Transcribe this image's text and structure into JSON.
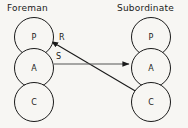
{
  "diagram": {
    "background_color": "#f7f6f3",
    "stroke_color": "#1a1a1a",
    "columns": [
      {
        "id": "foreman",
        "title": "Foreman",
        "nodes": [
          {
            "id": "foreman-p",
            "label": "P"
          },
          {
            "id": "foreman-a",
            "label": "A"
          },
          {
            "id": "foreman-c",
            "label": "C"
          }
        ]
      },
      {
        "id": "subordinate",
        "title": "Subordinate",
        "nodes": [
          {
            "id": "subordinate-p",
            "label": "P"
          },
          {
            "id": "subordinate-a",
            "label": "A"
          },
          {
            "id": "subordinate-c",
            "label": "C"
          }
        ]
      }
    ],
    "edges": [
      {
        "id": "edge-r",
        "label": "R",
        "from": "subordinate-c",
        "to": "foreman-p",
        "style": "solid-arrow"
      },
      {
        "id": "edge-s",
        "label": "S",
        "from": "foreman-a",
        "to": "subordinate-a",
        "style": "solid-arrow"
      }
    ]
  }
}
